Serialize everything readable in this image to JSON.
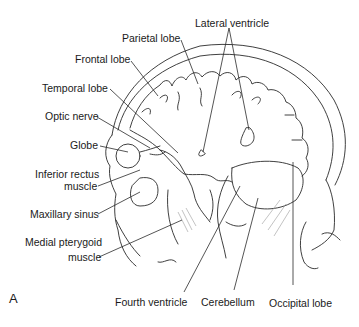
{
  "figure": {
    "panel_label": "A",
    "line_color": "#2a2a2a",
    "background": "#ffffff",
    "labels": {
      "parietal_lobe": "Parietal lobe",
      "lateral_ventricle": "Lateral ventricle",
      "frontal_lobe": "Frontal lobe",
      "temporal_lobe": "Temporal lobe",
      "optic_nerve": "Optic nerve",
      "globe": "Globe",
      "inferior_rectus_1": "Inferior rectus",
      "inferior_rectus_2": "muscle",
      "maxillary_sinus": "Maxillary sinus",
      "medial_pterygoid_1": "Medial pterygoid",
      "medial_pterygoid_2": "muscle",
      "fourth_ventricle": "Fourth ventricle",
      "cerebellum": "Cerebellum",
      "occipital_lobe": "Occipital lobe"
    }
  }
}
